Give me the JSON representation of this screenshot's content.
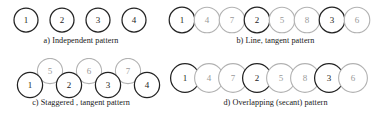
{
  "figure": {
    "background_color": "#ffffff",
    "dark_stroke": "#232323",
    "light_stroke": "#b2b2b2",
    "dark_label_color": "#1d1d1d",
    "light_label_color": "#9a9a9a"
  },
  "panels": [
    {
      "id": "a",
      "caption": "a) Independent pattern",
      "layout": "independent",
      "rows": 1,
      "circles": [
        {
          "label": "1",
          "tone": "dark",
          "cx": 26,
          "cy": 18,
          "r": 12
        },
        {
          "label": "2",
          "tone": "dark",
          "cx": 62,
          "cy": 18,
          "r": 12
        },
        {
          "label": "3",
          "tone": "dark",
          "cx": 98,
          "cy": 18,
          "r": 12
        },
        {
          "label": "4",
          "tone": "dark",
          "cx": 134,
          "cy": 18,
          "r": 12
        }
      ]
    },
    {
      "id": "b",
      "caption": "b) Line, tangent pattern",
      "layout": "tangent-line",
      "rows": 1,
      "circles": [
        {
          "label": "1",
          "tone": "dark",
          "cx": 17,
          "cy": 18,
          "r": 12.8
        },
        {
          "label": "4",
          "tone": "light",
          "cx": 42,
          "cy": 18,
          "r": 12.8
        },
        {
          "label": "7",
          "tone": "light",
          "cx": 67,
          "cy": 18,
          "r": 12.8
        },
        {
          "label": "2",
          "tone": "dark",
          "cx": 92,
          "cy": 18,
          "r": 12.8
        },
        {
          "label": "5",
          "tone": "light",
          "cx": 117,
          "cy": 18,
          "r": 12.8
        },
        {
          "label": "8",
          "tone": "light",
          "cx": 142,
          "cy": 18,
          "r": 12.8
        },
        {
          "label": "3",
          "tone": "dark",
          "cx": 167,
          "cy": 18,
          "r": 12.8
        },
        {
          "label": "6",
          "tone": "light",
          "cx": 192,
          "cy": 18,
          "r": 12.8
        }
      ]
    },
    {
      "id": "c",
      "caption": "c) Staggered , tangent pattern",
      "layout": "staggered-tangent",
      "rows": 2,
      "circles": [
        {
          "label": "5",
          "tone": "light",
          "cx": 50,
          "cy": 13,
          "r": 12.6
        },
        {
          "label": "6",
          "tone": "light",
          "cx": 89,
          "cy": 13,
          "r": 12.6
        },
        {
          "label": "7",
          "tone": "light",
          "cx": 128,
          "cy": 13,
          "r": 12.6
        },
        {
          "label": "1",
          "tone": "dark",
          "cx": 30,
          "cy": 27,
          "r": 12.6
        },
        {
          "label": "2",
          "tone": "dark",
          "cx": 69,
          "cy": 27,
          "r": 12.6
        },
        {
          "label": "3",
          "tone": "dark",
          "cx": 108,
          "cy": 27,
          "r": 12.6
        },
        {
          "label": "4",
          "tone": "dark",
          "cx": 147,
          "cy": 27,
          "r": 12.6
        }
      ]
    },
    {
      "id": "d",
      "caption": "d) Overlapping (secant) pattern",
      "layout": "overlapping-secant",
      "rows": 1,
      "circles": [
        {
          "label": "1",
          "tone": "dark",
          "cx": 20,
          "cy": 20,
          "r": 14.4
        },
        {
          "label": "4",
          "tone": "light",
          "cx": 44,
          "cy": 20,
          "r": 14.4
        },
        {
          "label": "7",
          "tone": "light",
          "cx": 68,
          "cy": 20,
          "r": 14.4
        },
        {
          "label": "2",
          "tone": "dark",
          "cx": 92,
          "cy": 20,
          "r": 14.4
        },
        {
          "label": "5",
          "tone": "light",
          "cx": 116,
          "cy": 20,
          "r": 14.4
        },
        {
          "label": "8",
          "tone": "light",
          "cx": 140,
          "cy": 20,
          "r": 14.4
        },
        {
          "label": "3",
          "tone": "dark",
          "cx": 164,
          "cy": 20,
          "r": 14.4
        },
        {
          "label": "6",
          "tone": "light",
          "cx": 188,
          "cy": 20,
          "r": 14.4
        }
      ]
    }
  ]
}
